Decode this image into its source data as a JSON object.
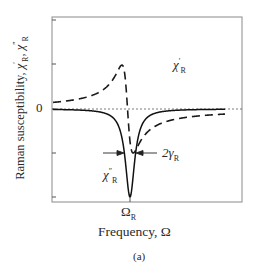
{
  "chart_data": {
    "type": "line",
    "title": "",
    "caption": "(a)",
    "xlabel": "Frequency, Ω",
    "ylabel": "Raman susceptibility, χ′R, χ″R",
    "x_tick_labels": [
      "ΩR"
    ],
    "y_tick_labels": [
      "0"
    ],
    "grid": false,
    "reference_lines": [
      {
        "type": "horizontal",
        "y": 0,
        "style": "dotted"
      }
    ],
    "annotations": [
      {
        "text": "χ′R",
        "near": "peak of dashed curve"
      },
      {
        "text": "χ″R",
        "near": "dip of solid curve"
      },
      {
        "text": "2γR",
        "meaning": "full width of χ″R dip, marked by arrows"
      }
    ],
    "x": [
      -1.0,
      -0.8,
      -0.6,
      -0.4,
      -0.3,
      -0.2,
      -0.12,
      -0.08,
      -0.04,
      0.0,
      0.04,
      0.08,
      0.12,
      0.2,
      0.3,
      0.4,
      0.6,
      0.8,
      1.0
    ],
    "series": [
      {
        "name": "χ′R",
        "style": "dashed",
        "values": [
          -0.09,
          -0.12,
          -0.17,
          -0.27,
          -0.36,
          -0.52,
          -0.7,
          -0.72,
          -0.5,
          0.0,
          0.5,
          0.72,
          0.7,
          0.52,
          0.36,
          0.27,
          0.17,
          0.12,
          0.09
        ]
      },
      {
        "name": "χ″R",
        "style": "solid",
        "values": [
          -0.01,
          -0.02,
          -0.03,
          -0.06,
          -0.1,
          -0.2,
          -0.41,
          -0.61,
          -0.86,
          -1.0,
          -0.86,
          -0.61,
          -0.41,
          -0.2,
          -0.1,
          -0.06,
          -0.03,
          -0.02,
          -0.01
        ]
      }
    ],
    "xlim": [
      -1.35,
      1.35
    ],
    "ylim": [
      -1.0,
      1.0
    ]
  },
  "labels": {
    "ylabel_prefix": "Raman susceptibility, ",
    "chi": "χ",
    "prime": "′",
    "dprime": "″",
    "R": "R",
    "sep": ", ",
    "zero": "0",
    "omega": "Ω",
    "xlabel": "Frequency, Ω",
    "caption": "(a)",
    "two_gamma": "2γ"
  }
}
